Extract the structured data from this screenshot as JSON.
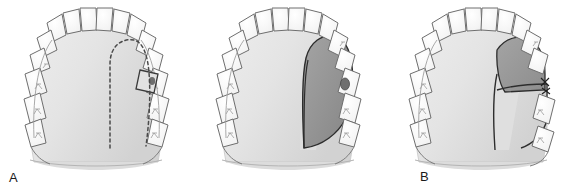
{
  "figure": {
    "background_color": "#ffffff",
    "width": 578,
    "height": 194,
    "panel_count": 3
  },
  "colors": {
    "outline": "#3a3a3a",
    "tooth_fill": "#fdfdfd",
    "tooth_outline": "#6e6e6e",
    "palate_fill_light": "#e9e9e9",
    "palate_fill_mid": "#dcdcdc",
    "palate_shadow": "#cfcfcf",
    "flap_fill": "#9c9c9c",
    "flap_fill_dark": "#8a8a8a",
    "flap_outline": "#2d2d2d",
    "defect_fill": "#6f6f6f",
    "incision_dashed": "#4a4a4a",
    "label_color": "#1a1a1a"
  },
  "panels": [
    {
      "id": "a",
      "label": "A",
      "caption": "Outline of planned palatal rotation flap with dashed incision line; oroantral defect at the maxillary first molar site",
      "anatomy": "maxillary arch occlusal view",
      "teeth_count": 14,
      "features": [
        {
          "name": "dashed-incision-line",
          "style": "dashed",
          "description": "planned palatal flap incision running from midline anteriorly and curving around the palate to the defect"
        },
        {
          "name": "oroantral-defect",
          "description": "dark socket between the second premolar and second molar on the patient left side"
        },
        {
          "name": "palate-surface",
          "description": "shaded hard palate with midline raphe"
        }
      ]
    },
    {
      "id": "b",
      "label": "B",
      "caption": "Palatal flap elevated and raised, exposing denuded bone; flap based on the greater palatine artery",
      "anatomy": "maxillary arch occlusal view",
      "teeth_count": 14,
      "features": [
        {
          "name": "elevated-palatal-flap",
          "description": "dark gray wedge-shaped flap lifted off the palate"
        },
        {
          "name": "donor-site",
          "description": "denuded palatal bone left after flap elevation"
        },
        {
          "name": "oroantral-defect",
          "description": "dark socket at the molar region"
        }
      ]
    },
    {
      "id": "c",
      "label": "C",
      "caption": "Flap rotated laterally over the oroantral defect and sutured into place",
      "anatomy": "maxillary arch occlusal view",
      "teeth_count": 14,
      "features": [
        {
          "name": "rotated-flap",
          "description": "flap swung laterally to cover the defect"
        },
        {
          "name": "suture-line",
          "description": "sutures securing the rotated flap margin"
        },
        {
          "name": "exposed-donor-bone",
          "description": "remaining palatal donor area"
        }
      ]
    }
  ],
  "labels": {
    "a": "A",
    "b": "B",
    "c": "C"
  }
}
